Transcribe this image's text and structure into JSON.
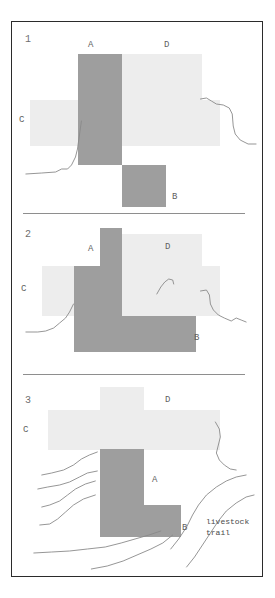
{
  "figure": {
    "type": "diagram",
    "panels": [
      {
        "number": "1",
        "regions": [
          {
            "key": "A",
            "label": "A",
            "shade": "dark",
            "role": "parcel"
          },
          {
            "key": "B",
            "label": "B",
            "shade": "dark",
            "role": "parcel"
          },
          {
            "key": "C",
            "label": "C",
            "shade": "light",
            "role": "parcel"
          },
          {
            "key": "D",
            "label": "D",
            "shade": "light",
            "role": "parcel"
          }
        ]
      },
      {
        "number": "2",
        "regions": [
          {
            "key": "A",
            "label": "A",
            "shade": "dark",
            "role": "parcel"
          },
          {
            "key": "B",
            "label": "B",
            "shade": "dark",
            "role": "parcel"
          },
          {
            "key": "C",
            "label": "C",
            "shade": "light",
            "role": "parcel"
          },
          {
            "key": "D",
            "label": "D",
            "shade": "light",
            "role": "parcel"
          }
        ]
      },
      {
        "number": "3",
        "regions": [
          {
            "key": "A",
            "label": "A",
            "shade": "dark",
            "role": "parcel"
          },
          {
            "key": "B",
            "label": "B",
            "shade": "dark",
            "role": "parcel"
          },
          {
            "key": "C",
            "label": "C",
            "shade": "light",
            "role": "parcel"
          },
          {
            "key": "D",
            "label": "D",
            "shade": "light",
            "role": "parcel"
          }
        ],
        "annotation": {
          "line1": "livestock",
          "line2": "trail"
        }
      }
    ],
    "colors": {
      "dark_parcel": "#9e9e9e",
      "light_parcel": "#ededed",
      "terrain_line": "#8a8a8a",
      "frame": "#2b2b2b",
      "divider": "#8e8e8e",
      "background": "#ffffff",
      "label_text": "#5f5f5f"
    }
  }
}
